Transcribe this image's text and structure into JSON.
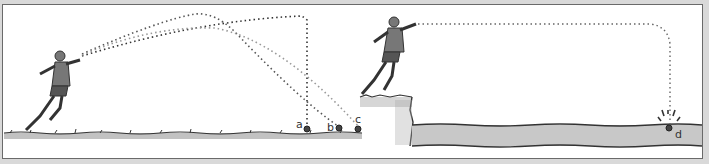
{
  "figure": {
    "panels": [
      {
        "id": "left",
        "scene": "runner throwing ball on level ground",
        "trajectories": [
          {
            "label": "a",
            "style": "steep drop"
          },
          {
            "label": "b",
            "style": "arc"
          },
          {
            "label": "c",
            "style": "long arc"
          }
        ]
      },
      {
        "id": "right",
        "scene": "runner throwing ball from cliff edge into water",
        "trajectories": [
          {
            "label": "d",
            "style": "horizontal then vertical drop into water"
          }
        ]
      }
    ],
    "labels": {
      "a": "a",
      "b": "b",
      "c": "c",
      "d": "d"
    },
    "colors": {
      "frame": "#6a6a6a",
      "ground": "#555555",
      "water": "#c8c8c8",
      "path": "#333333",
      "path_light": "#888888"
    }
  }
}
